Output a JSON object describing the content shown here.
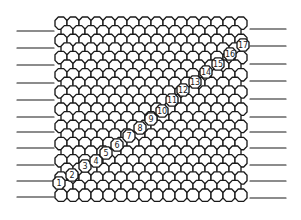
{
  "figure": {
    "colors": {
      "line": "#1a1a1a",
      "background": "#ffffff"
    },
    "lattice": {
      "cell_width": 12.0,
      "row_height": 8.6,
      "x_start": 55,
      "x_end": 250,
      "y_start": 17,
      "y_end": 203
    },
    "left_leads": {
      "x_from": 17,
      "x_to": 54,
      "y": [
        31,
        48,
        65,
        83,
        100,
        117,
        132,
        148,
        165,
        181,
        197
      ]
    },
    "right_leads": {
      "x_from": 250,
      "x_to": 286,
      "y": [
        29,
        46,
        64,
        81,
        99,
        117,
        132,
        148,
        165,
        181,
        198
      ]
    },
    "numbered_cells": [
      {
        "label": "1",
        "x": 59,
        "y": 183
      },
      {
        "label": "2",
        "x": 72,
        "y": 175
      },
      {
        "label": "3",
        "x": 85,
        "y": 166
      },
      {
        "label": "4",
        "x": 96,
        "y": 161
      },
      {
        "label": "5",
        "x": 106,
        "y": 153
      },
      {
        "label": "6",
        "x": 117,
        "y": 145
      },
      {
        "label": "7",
        "x": 129,
        "y": 136
      },
      {
        "label": "8",
        "x": 140,
        "y": 128
      },
      {
        "label": "9",
        "x": 151,
        "y": 119
      },
      {
        "label": "10",
        "x": 162,
        "y": 111
      },
      {
        "label": "11",
        "x": 172,
        "y": 100
      },
      {
        "label": "12",
        "x": 183,
        "y": 90
      },
      {
        "label": "13",
        "x": 195,
        "y": 82
      },
      {
        "label": "14",
        "x": 206,
        "y": 72
      },
      {
        "label": "15",
        "x": 218,
        "y": 64
      },
      {
        "label": "16",
        "x": 230,
        "y": 54
      },
      {
        "label": "17",
        "x": 243,
        "y": 45
      }
    ]
  }
}
